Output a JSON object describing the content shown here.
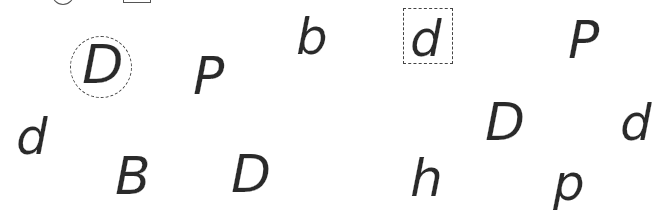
{
  "worksheet": {
    "letters": [
      {
        "char": "D",
        "x": 82,
        "y": 38,
        "size": 54,
        "marked": "circle"
      },
      {
        "char": "P",
        "x": 193,
        "y": 50,
        "size": 52
      },
      {
        "char": "b",
        "x": 296,
        "y": 12,
        "size": 50
      },
      {
        "char": "d",
        "x": 410,
        "y": 14,
        "size": 50,
        "marked": "box"
      },
      {
        "char": "P",
        "x": 568,
        "y": 14,
        "size": 52
      },
      {
        "char": "d",
        "x": 16,
        "y": 112,
        "size": 50
      },
      {
        "char": "B",
        "x": 115,
        "y": 150,
        "size": 52
      },
      {
        "char": "D",
        "x": 231,
        "y": 148,
        "size": 52
      },
      {
        "char": "D",
        "x": 485,
        "y": 96,
        "size": 52
      },
      {
        "char": "d",
        "x": 620,
        "y": 98,
        "size": 50
      },
      {
        "char": "h",
        "x": 410,
        "y": 152,
        "size": 52
      },
      {
        "char": "p",
        "x": 553,
        "y": 158,
        "size": 50
      }
    ],
    "marks": {
      "circle": {
        "x": 70,
        "y": 36,
        "w": 62,
        "h": 62
      },
      "box": {
        "x": 403,
        "y": 8,
        "w": 50,
        "h": 56
      },
      "top_partial_circle": {
        "x": 52,
        "y": -12,
        "w": 22,
        "h": 17
      },
      "top_partial_box": {
        "x": 123,
        "y": -10,
        "w": 28,
        "h": 13
      }
    },
    "ink_color": "#2a2a2a"
  }
}
